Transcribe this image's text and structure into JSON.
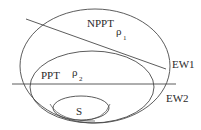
{
  "diagram": {
    "colors": {
      "stroke": "#4a4a4a",
      "text": "#2a2a2a",
      "background": "#ffffff"
    },
    "regions": [
      {
        "id": "nppt",
        "label": "NPPT",
        "density_symbol": "ρ",
        "density_subscript": "1"
      },
      {
        "id": "ppt",
        "label": "PPT",
        "density_symbol": "ρ",
        "density_subscript": "2"
      },
      {
        "id": "s",
        "label": "S"
      }
    ],
    "lines": [
      {
        "id": "ew1",
        "label": "EW1"
      },
      {
        "id": "ew2",
        "label": "EW2"
      }
    ]
  }
}
